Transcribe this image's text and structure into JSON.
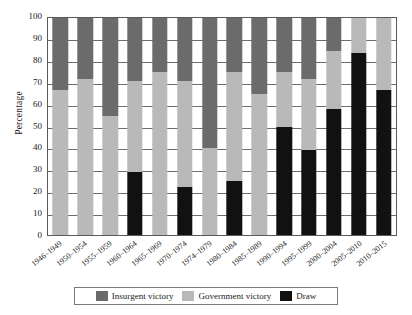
{
  "chart_data": {
    "type": "bar",
    "title": "",
    "xlabel": "",
    "ylabel": "Percentage",
    "ylim": [
      0,
      100
    ],
    "ytick_step": 10,
    "yticks": [
      "0",
      "10",
      "20",
      "30",
      "40",
      "50",
      "60",
      "70",
      "80",
      "90",
      "100"
    ],
    "grid": true,
    "stacked": true,
    "stack_order_bottom_to_top": [
      "Draw",
      "Government victory",
      "Insurgent victory"
    ],
    "legend_position": "bottom-center",
    "categories": [
      "1946–1949",
      "1950–1954",
      "1955–1959",
      "1960–1964",
      "1965–1969",
      "1970–1974",
      "1974–1979",
      "1980–1984",
      "1985–1989",
      "1990–1994",
      "1995–1999",
      "2000–2004",
      "2005–2010",
      "2010–2015"
    ],
    "series": [
      {
        "name": "Insurgent victory",
        "color": "#6b6b6b",
        "values": [
          33,
          28,
          45,
          29,
          25,
          29,
          60,
          25,
          35,
          25,
          28,
          15,
          0,
          0
        ]
      },
      {
        "name": "Government victory",
        "color": "#b9b9b9",
        "values": [
          67,
          72,
          55,
          42,
          75,
          49,
          40,
          50,
          65,
          25,
          33,
          27,
          16,
          33
        ]
      },
      {
        "name": "Draw",
        "color": "#111111",
        "values": [
          0,
          0,
          0,
          29,
          0,
          22,
          0,
          25,
          0,
          50,
          39,
          58,
          84,
          67
        ]
      }
    ],
    "cumulative_tops": {
      "note": "upper boundary of each stack segment, bottom to top",
      "draw_top": [
        0,
        0,
        0,
        29,
        0,
        22,
        0,
        25,
        0,
        50,
        39,
        58,
        84,
        67
      ],
      "government_top": [
        67,
        72,
        55,
        71,
        75,
        71,
        40,
        75,
        65,
        75,
        72,
        85,
        100,
        100
      ],
      "insurgent_top": [
        100,
        100,
        100,
        100,
        100,
        100,
        100,
        100,
        100,
        100,
        100,
        100,
        100,
        100
      ]
    }
  },
  "legend": {
    "items": [
      {
        "label": "Insurgent victory",
        "color": "#6b6b6b"
      },
      {
        "label": "Government victory",
        "color": "#b9b9b9"
      },
      {
        "label": "Draw",
        "color": "#111111"
      }
    ]
  },
  "axes": {
    "y_title": "Percentage"
  }
}
